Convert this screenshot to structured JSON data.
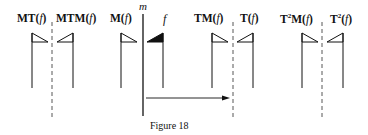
{
  "figure": {
    "caption": "Figure 18",
    "mirror_line_label": "m",
    "original_label": "f",
    "labels": [
      {
        "id": "MT",
        "prefix": "MT",
        "sup": "",
        "suffix": "",
        "arg": "f"
      },
      {
        "id": "MTM",
        "prefix": "MTM",
        "sup": "",
        "suffix": "",
        "arg": "f"
      },
      {
        "id": "M",
        "prefix": "M",
        "sup": "",
        "suffix": "",
        "arg": "f"
      },
      {
        "id": "TM",
        "prefix": "TM",
        "sup": "",
        "suffix": "",
        "arg": "f"
      },
      {
        "id": "T",
        "prefix": "T",
        "sup": "",
        "suffix": "",
        "arg": "f"
      },
      {
        "id": "T2M",
        "prefix": "T",
        "sup": "2",
        "suffix": "M",
        "arg": "f"
      },
      {
        "id": "T2",
        "prefix": "T",
        "sup": "2",
        "suffix": "",
        "arg": "f"
      }
    ],
    "flags": [
      {
        "name": "MT(f)",
        "orientation": "right",
        "filled": false
      },
      {
        "name": "MTM(f)",
        "orientation": "left",
        "filled": false
      },
      {
        "name": "M(f)",
        "orientation": "right",
        "filled": false
      },
      {
        "name": "f",
        "orientation": "left",
        "filled": true
      },
      {
        "name": "TM(f)",
        "orientation": "right",
        "filled": false
      },
      {
        "name": "T(f)",
        "orientation": "left",
        "filled": false
      },
      {
        "name": "T2M(f)",
        "orientation": "right",
        "filled": false
      },
      {
        "name": "T2(f)",
        "orientation": "left",
        "filled": false
      }
    ],
    "translation_arrow": {
      "direction": "right",
      "meaning": "translation T"
    },
    "dashed_lines": 3,
    "solid_mirror_lines": 1
  }
}
